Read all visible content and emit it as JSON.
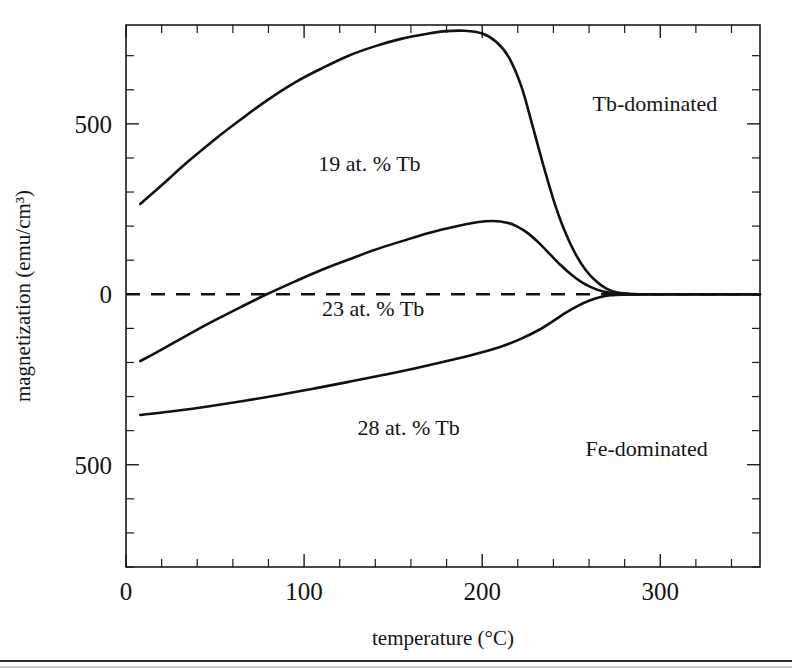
{
  "chart_data": {
    "type": "line",
    "title": "",
    "xlabel": "temperature (°C)",
    "ylabel": "magnetization (emu/cm³)",
    "xlim": [
      0,
      356
    ],
    "ylim": [
      -800,
      790
    ],
    "grid": false,
    "legend_position": "inline-labels",
    "x_ticks_major": [
      0,
      100,
      200,
      300
    ],
    "x_tick_labels": [
      "0",
      "100",
      "200",
      "300"
    ],
    "x_tick_minor_step": 20,
    "y_ticks_major": [
      500,
      0,
      -500
    ],
    "y_tick_labels": [
      "500",
      "0",
      "500"
    ],
    "y_tick_minor_step": 100,
    "zero_reference_line": {
      "value": 0,
      "style": "dashed",
      "label": ""
    },
    "annotations": [
      {
        "name": "region-tb-dominated",
        "text": "Tb-dominated",
        "x": 262,
        "y": 560
      },
      {
        "name": "region-fe-dominated",
        "text": "Fe-dominated",
        "x": 258,
        "y": -450
      }
    ],
    "series": [
      {
        "name": "19 at. % Tb",
        "label": "19 at. % Tb",
        "label_x": 108,
        "label_y": 385,
        "points": [
          [
            8,
            265
          ],
          [
            20,
            320
          ],
          [
            35,
            390
          ],
          [
            50,
            455
          ],
          [
            65,
            515
          ],
          [
            80,
            572
          ],
          [
            95,
            622
          ],
          [
            110,
            663
          ],
          [
            125,
            700
          ],
          [
            140,
            728
          ],
          [
            155,
            750
          ],
          [
            170,
            765
          ],
          [
            180,
            772
          ],
          [
            190,
            773
          ],
          [
            200,
            765
          ],
          [
            208,
            740
          ],
          [
            215,
            695
          ],
          [
            222,
            610
          ],
          [
            228,
            500
          ],
          [
            234,
            385
          ],
          [
            240,
            278
          ],
          [
            246,
            190
          ],
          [
            252,
            122
          ],
          [
            258,
            72
          ],
          [
            264,
            38
          ],
          [
            270,
            16
          ],
          [
            276,
            5
          ],
          [
            284,
            1
          ],
          [
            300,
            0
          ],
          [
            330,
            0
          ],
          [
            356,
            0
          ]
        ]
      },
      {
        "name": "23 at. % Tb",
        "label": "23 at. % Tb",
        "label_x": 110,
        "label_y": -40,
        "points": [
          [
            8,
            -196
          ],
          [
            20,
            -162
          ],
          [
            35,
            -118
          ],
          [
            50,
            -76
          ],
          [
            65,
            -36
          ],
          [
            79,
            0
          ],
          [
            95,
            38
          ],
          [
            110,
            72
          ],
          [
            125,
            102
          ],
          [
            140,
            131
          ],
          [
            155,
            156
          ],
          [
            170,
            180
          ],
          [
            185,
            199
          ],
          [
            198,
            212
          ],
          [
            206,
            215
          ],
          [
            214,
            210
          ],
          [
            220,
            198
          ],
          [
            226,
            178
          ],
          [
            232,
            150
          ],
          [
            238,
            118
          ],
          [
            244,
            86
          ],
          [
            250,
            58
          ],
          [
            256,
            35
          ],
          [
            262,
            19
          ],
          [
            268,
            8
          ],
          [
            276,
            2
          ],
          [
            286,
            0
          ],
          [
            310,
            0
          ],
          [
            356,
            0
          ]
        ]
      },
      {
        "name": "28 at. % Tb",
        "label": "28 at. % Tb",
        "label_x": 130,
        "label_y": -390,
        "points": [
          [
            8,
            -354
          ],
          [
            25,
            -344
          ],
          [
            45,
            -330
          ],
          [
            65,
            -314
          ],
          [
            85,
            -296
          ],
          [
            105,
            -277
          ],
          [
            125,
            -257
          ],
          [
            145,
            -236
          ],
          [
            165,
            -214
          ],
          [
            185,
            -190
          ],
          [
            200,
            -170
          ],
          [
            212,
            -151
          ],
          [
            222,
            -130
          ],
          [
            232,
            -104
          ],
          [
            240,
            -78
          ],
          [
            247,
            -54
          ],
          [
            254,
            -33
          ],
          [
            260,
            -19
          ],
          [
            266,
            -9
          ],
          [
            272,
            -3
          ],
          [
            280,
            -1
          ],
          [
            295,
            0
          ],
          [
            320,
            0
          ],
          [
            356,
            0
          ]
        ]
      }
    ]
  },
  "page": {
    "has_bottom_rule": true
  }
}
